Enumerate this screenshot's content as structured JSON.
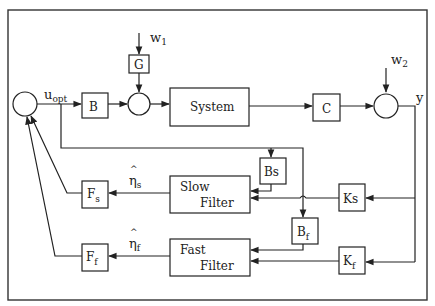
{
  "diagram": {
    "type": "control-block-diagram",
    "blocks": {
      "B": {
        "label": "B"
      },
      "G": {
        "label": "G"
      },
      "system": {
        "label": "System"
      },
      "C": {
        "label": "C"
      },
      "Bs": {
        "label": "Bs"
      },
      "Ks": {
        "label": "Ks"
      },
      "Bf": {
        "label": "B",
        "sub": "f"
      },
      "Kf": {
        "label": "K",
        "sub": "f"
      },
      "slow_filter": {
        "line1": "Slow",
        "line2": "Filter"
      },
      "fast_filter": {
        "line1": "Fast",
        "line2": "Filter"
      },
      "Fs": {
        "label": "F",
        "sub": "s"
      },
      "Ff": {
        "label": "F",
        "sub": "f"
      }
    },
    "signals": {
      "u_opt": {
        "label": "u",
        "sub": "opt"
      },
      "w1": {
        "label": "w",
        "sub": "1"
      },
      "w2": {
        "label": "w",
        "sub": "2"
      },
      "y": {
        "label": "y"
      },
      "eta_s": {
        "hat": "^",
        "label": "η",
        "sub": "s"
      },
      "eta_f": {
        "hat": "^",
        "label": "η",
        "sub": "f"
      }
    },
    "summing_junctions": [
      "controller-sum",
      "input-sum",
      "output-sum"
    ],
    "connections": [
      [
        "controller-sum",
        "B"
      ],
      [
        "B",
        "input-sum"
      ],
      [
        "w1",
        "G"
      ],
      [
        "G",
        "input-sum"
      ],
      [
        "input-sum",
        "system"
      ],
      [
        "system",
        "C"
      ],
      [
        "C",
        "output-sum"
      ],
      [
        "w2",
        "output-sum"
      ],
      [
        "output-sum",
        "y"
      ],
      [
        "y",
        "Ks"
      ],
      [
        "y",
        "Kf"
      ],
      [
        "Ks",
        "slow_filter"
      ],
      [
        "Kf",
        "fast_filter"
      ],
      [
        "u_opt",
        "Bs"
      ],
      [
        "u_opt",
        "Bf"
      ],
      [
        "Bs",
        "slow_filter"
      ],
      [
        "Bf",
        "fast_filter"
      ],
      [
        "slow_filter",
        "Fs"
      ],
      [
        "fast_filter",
        "Ff"
      ],
      [
        "Fs",
        "controller-sum"
      ],
      [
        "Ff",
        "controller-sum"
      ]
    ]
  }
}
